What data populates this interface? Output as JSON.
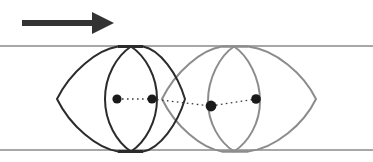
{
  "figure": {
    "background_color": "#ffffff",
    "width": 373,
    "height": 162
  },
  "flow_arrow": {
    "label": "flow-direction-arrow",
    "color": "#333333",
    "shaft_start_x": 22,
    "shaft_end_x": 96,
    "shaft_y": 23,
    "shaft_thickness": 6,
    "head_tip_x": 114,
    "head_half_height": 11
  },
  "channel": {
    "label": "channel-walls",
    "color": "#8a8a8a",
    "line_width": 1.4,
    "top_y": 46,
    "bottom_y": 150,
    "x_start": 0,
    "x_end": 373
  },
  "shapes": [
    {
      "name": "dark-particle",
      "color": "#2b2b2b",
      "line_width": 2.0,
      "lens": {
        "left_apex_x": 57,
        "right_apex_x": 185,
        "apex_y": 99,
        "top_y": 46,
        "bottom_y": 150,
        "top_flat_x1": 118,
        "top_flat_x2": 143,
        "bottom_flat_x1": 118,
        "bottom_flat_x2": 143
      },
      "oval": {
        "center_x": 131,
        "center_y": 99,
        "rx": 26,
        "ry": 53
      },
      "dots": [
        {
          "x": 117,
          "y": 99,
          "r": 4.6
        },
        {
          "x": 152,
          "y": 99,
          "r": 4.6
        }
      ],
      "dotted_link": {
        "x1": 117,
        "y1": 99,
        "x2": 152,
        "y2": 99
      }
    },
    {
      "name": "light-particle",
      "color": "#8c8c8c",
      "line_width": 2.0,
      "lens": {
        "left_apex_x": 162,
        "right_apex_x": 316,
        "apex_y": 99,
        "top_y": 46,
        "bottom_y": 150,
        "top_flat_x1": 222,
        "top_flat_x2": 248,
        "bottom_flat_x1": 222,
        "bottom_flat_x2": 248
      },
      "oval": {
        "center_x": 234,
        "center_y": 101,
        "rx": 26,
        "ry": 52
      },
      "dots": [
        {
          "x": 211,
          "y": 106,
          "r": 5.4
        },
        {
          "x": 256,
          "y": 99,
          "r": 4.8
        }
      ],
      "dotted_link": {
        "x1": 211,
        "y1": 106,
        "x2": 256,
        "y2": 99
      }
    }
  ],
  "dotted_line_style": {
    "color": "#3a3a3a",
    "width": 1.3,
    "dash": "1.6 3.4"
  },
  "long_dotted_link": {
    "label": "inter-particle-dotted-line",
    "x1": 152,
    "y1": 99,
    "x2": 211,
    "y2": 106
  },
  "dot_color": "#1a1a1a"
}
